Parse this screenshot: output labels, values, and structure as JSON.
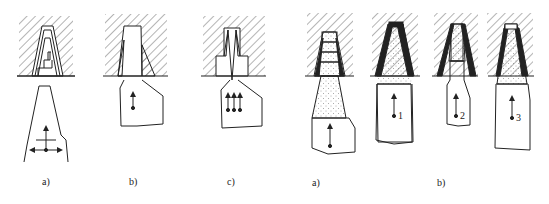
{
  "figures": [
    {
      "id": "left",
      "panels": [
        {
          "label": "a)",
          "x": 47,
          "description": "stepped die with layered billet, lateral and axial flow arrows"
        },
        {
          "label": "b)",
          "x": 135,
          "description": "die with dead-zone hatching, single axial arrow"
        },
        {
          "label": "c)",
          "x": 232,
          "description": "stepped die with dead zones, three parallel axial arrows"
        }
      ]
    },
    {
      "id": "right",
      "panels": [
        {
          "label": "a)",
          "x": 317,
          "description": "stepped layered die with dotted deformation zone"
        },
        {
          "label": "b)",
          "x": 443,
          "description": "three tapered dies with flow points",
          "points": [
            "1",
            "2",
            "3"
          ]
        }
      ]
    }
  ],
  "colors": {
    "line": "#222222",
    "hatch": "#333333",
    "fill": "#ffffff"
  }
}
